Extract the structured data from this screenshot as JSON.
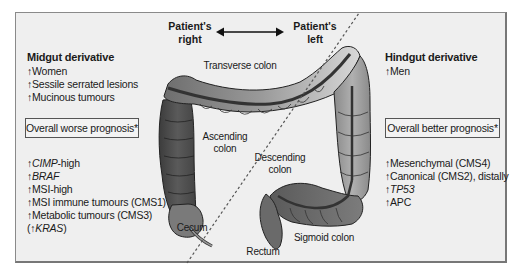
{
  "orientation": {
    "left_label_line1": "Patient's",
    "left_label_line2": "right",
    "right_label_line1": "Patient's",
    "right_label_line2": "left",
    "arrow_icon": "double-headed-arrow"
  },
  "midgut": {
    "title": "Midgut derivative",
    "features": [
      "↑Women",
      "↑Sessile serrated lesions",
      "↑Mucinous tumours"
    ],
    "prognosis": "Overall worse prognosis*",
    "molecular": [
      {
        "prefix": "↑",
        "text": "CIMP",
        "suffix": "-high",
        "italic": true
      },
      {
        "prefix": "↑",
        "text": "BRAF",
        "suffix": "",
        "italic": true
      },
      {
        "prefix": "↑",
        "text": "MSI-high",
        "suffix": "",
        "italic": false
      },
      {
        "prefix": "↑",
        "text": "MSI immune tumours (CMS1)",
        "suffix": "",
        "italic": false
      },
      {
        "prefix": "↑",
        "text": "Metabolic tumours (CMS3)",
        "suffix": "",
        "italic": false
      },
      {
        "prefix": "(↑",
        "text": "KRAS",
        "suffix": ")",
        "italic": true
      }
    ]
  },
  "hindgut": {
    "title": "Hindgut derivative",
    "features": [
      "↑Men"
    ],
    "prognosis": "Overall better prognosis*",
    "molecular": [
      {
        "prefix": "↑",
        "text": "Mesenchymal (CMS4)",
        "suffix": "",
        "italic": false
      },
      {
        "prefix": "↑",
        "text": "Canonical (CMS2), distally",
        "suffix": "",
        "italic": false
      },
      {
        "prefix": "↑",
        "text": "TP53",
        "suffix": "",
        "italic": true
      },
      {
        "prefix": "↑",
        "text": "APC",
        "suffix": "",
        "italic": false
      }
    ]
  },
  "anatomy_labels": {
    "transverse": "Transverse colon",
    "ascending_1": "Ascending",
    "ascending_2": "colon",
    "descending_1": "Descending",
    "descending_2": "colon",
    "cecum": "Cecum",
    "rectum": "Rectum",
    "sigmoid": "Sigmoid colon"
  },
  "colors": {
    "frame_bg": "#efefef",
    "frame_border": "#7a7a7a",
    "colon_dark": "#4a4a4a",
    "colon_mid": "#8c8c8c",
    "colon_light": "#c8c8c8"
  }
}
